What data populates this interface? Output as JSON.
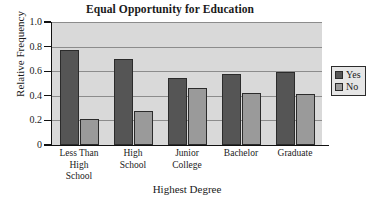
{
  "chart_data": {
    "type": "bar",
    "title": "Equal Opportunity for Education",
    "xlabel": "Highest Degree",
    "ylabel": "Relative Frequency",
    "categories": [
      "Less Than\nHigh\nSchool",
      "High\nSchool",
      "Junior\nCollege",
      "Bachelor",
      "Graduate"
    ],
    "series": [
      {
        "name": "Yes",
        "color": "#555555",
        "values": [
          0.77,
          0.7,
          0.545,
          0.575,
          0.59
        ]
      },
      {
        "name": "No",
        "color": "#9a9a9a",
        "values": [
          0.215,
          0.275,
          0.46,
          0.425,
          0.415
        ]
      }
    ],
    "ylim": [
      0,
      1.0
    ],
    "yticks": [
      "0",
      "0.2",
      "0.4",
      "0.6",
      "0.8",
      "1.0"
    ],
    "ytick_values": [
      0,
      0.2,
      0.4,
      0.6,
      0.8,
      1.0
    ],
    "grid": true,
    "legend_position": "right",
    "plot_background": "#d9d9d9",
    "gridline_color": "#8c8c8c"
  },
  "legend": {
    "entries": [
      {
        "label": "Yes"
      },
      {
        "label": "No"
      }
    ]
  }
}
